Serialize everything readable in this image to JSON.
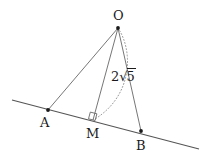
{
  "figure": {
    "type": "geometry-diagram",
    "background_color": "#ffffff",
    "stroke_color": "#555555",
    "label_color": "#1a1a1a",
    "width": 212,
    "height": 162,
    "points": [
      {
        "name": "O",
        "label": "O",
        "x": 118,
        "y": 28,
        "label_x": 113,
        "label_y": 9
      },
      {
        "name": "A",
        "label": "A",
        "x": 48,
        "y": 110,
        "label_x": 40,
        "label_y": 116
      },
      {
        "name": "M",
        "label": "M",
        "x": 93,
        "y": 120,
        "label_x": 86,
        "label_y": 127
      },
      {
        "name": "B",
        "label": "B",
        "x": 141,
        "y": 131,
        "label_x": 136,
        "label_y": 139
      }
    ],
    "secant_line": {
      "from_x": 12,
      "from_y": 100,
      "to_x": 199,
      "to_y": 149
    },
    "segments": [
      {
        "name": "OA",
        "from": "O",
        "to": "A"
      },
      {
        "name": "OM",
        "from": "O",
        "to": "M"
      },
      {
        "name": "OB",
        "from": "O",
        "to": "B"
      }
    ],
    "right_angle": {
      "at": "M",
      "size": 7
    },
    "arc": {
      "from": "O",
      "to": "M",
      "style": "dotted"
    },
    "measurements": [
      {
        "name": "om-length",
        "coefficient": "2",
        "radical_symbol": "√",
        "radicand": "5",
        "text": "2√5",
        "x": 111,
        "y": 70
      }
    ]
  }
}
